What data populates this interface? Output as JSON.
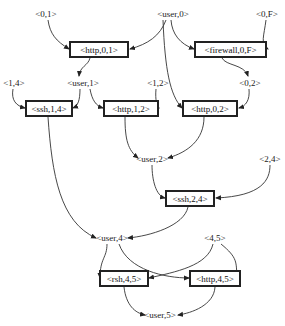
{
  "diagram": {
    "type": "attack-graph",
    "state_nodes": [
      {
        "id": "p01",
        "label": "<0,1>",
        "x": 46,
        "y": 14
      },
      {
        "id": "user0",
        "label": "<user,0>",
        "x": 173,
        "y": 14
      },
      {
        "id": "p0F",
        "label": "<0,F>",
        "x": 267,
        "y": 14
      },
      {
        "id": "p14",
        "label": "<1,4>",
        "x": 14,
        "y": 83
      },
      {
        "id": "user1",
        "label": "<user,1>",
        "x": 83,
        "y": 83
      },
      {
        "id": "p12",
        "label": "<1,2>",
        "x": 158,
        "y": 83
      },
      {
        "id": "p02",
        "label": "<0,2>",
        "x": 250,
        "y": 83
      },
      {
        "id": "user2",
        "label": "<user,2>",
        "x": 152,
        "y": 159
      },
      {
        "id": "p24",
        "label": "<2,4>",
        "x": 270,
        "y": 159
      },
      {
        "id": "user4",
        "label": "<user,4>",
        "x": 112,
        "y": 238
      },
      {
        "id": "p45",
        "label": "<4,5>",
        "x": 215,
        "y": 238
      },
      {
        "id": "user5",
        "label": "<user,5>",
        "x": 160,
        "y": 315
      }
    ],
    "action_nodes": [
      {
        "id": "http01",
        "label": "<http,0,1>",
        "x": 69,
        "y": 41,
        "w": 60,
        "h": 17
      },
      {
        "id": "fw0F",
        "label": "<firewall,0,F>",
        "x": 194,
        "y": 41,
        "w": 73,
        "h": 17
      },
      {
        "id": "ssh14",
        "label": "<ssh,1,4>",
        "x": 25,
        "y": 100,
        "w": 48,
        "h": 17
      },
      {
        "id": "http12",
        "label": "<http,1,2>",
        "x": 103,
        "y": 100,
        "w": 56,
        "h": 17
      },
      {
        "id": "http02",
        "label": "<http,0,2>",
        "x": 182,
        "y": 100,
        "w": 56,
        "h": 17
      },
      {
        "id": "ssh24",
        "label": "<ssh,2,4>",
        "x": 165,
        "y": 190,
        "w": 50,
        "h": 17
      },
      {
        "id": "rsh45",
        "label": "<rsh,4,5>",
        "x": 99,
        "y": 270,
        "w": 50,
        "h": 17
      },
      {
        "id": "http45",
        "label": "<http,4,5>",
        "x": 189,
        "y": 270,
        "w": 52,
        "h": 17
      }
    ],
    "edges": [
      {
        "from": "<0,1>",
        "to": "<http,0,1>",
        "d": "M48,20 C50,34 56,41 69,49"
      },
      {
        "from": "<user,0>",
        "to": "<http,0,1>",
        "d": "M166,20 C160,36 148,44 130,49"
      },
      {
        "from": "<user,0>",
        "to": "<firewall,0,F>",
        "d": "M171,20 C172,34 180,44 194,49"
      },
      {
        "from": "<0,F>",
        "to": "<firewall,0,F>",
        "d": "M266,20 C264,36 260,44 268,49"
      },
      {
        "from": "<http,0,1>",
        "to": "<user,1>",
        "d": "M90,58 C88,66 80,66 79,76"
      },
      {
        "from": "<firewall,0,F>",
        "to": "<0,2>",
        "d": "M222,58 C226,66 244,64 248,76"
      },
      {
        "from": "<user,0>",
        "to": "<http,0,2>",
        "d": "M163,20 C165,70 170,95 182,108"
      },
      {
        "from": "<0,2>",
        "to": "<http,0,2>",
        "d": "M249,89 C250,100 246,106 239,108"
      },
      {
        "from": "<1,4>",
        "to": "<ssh,1,4>",
        "d": "M13,89 C11,100 16,106 25,108"
      },
      {
        "from": "<user,1>",
        "to": "<ssh,1,4>",
        "d": "M80,89 C80,100 78,106 73,108"
      },
      {
        "from": "<user,1>",
        "to": "<http,1,2>",
        "d": "M90,89 C92,100 96,106 103,108"
      },
      {
        "from": "<1,2>",
        "to": "<http,1,2>",
        "d": "M156,89 C155,100 157,106 159,108"
      },
      {
        "from": "<http,1,2>",
        "to": "<user,2>",
        "d": "M125,117 C125,140 128,150 138,158"
      },
      {
        "from": "<http,0,2>",
        "to": "<user,2>",
        "d": "M204,117 C204,140 188,152 168,158"
      },
      {
        "from": "<user,2>",
        "to": "<ssh,2,4>",
        "d": "M152,165 C152,180 156,196 165,198"
      },
      {
        "from": "<2,4>",
        "to": "<ssh,2,4>",
        "d": "M270,165 C270,180 262,196 216,198"
      },
      {
        "from": "<ssh,1,4>",
        "to": "<user,4>",
        "d": "M48,117 C52,175 60,222 96,238"
      },
      {
        "from": "<ssh,2,4>",
        "to": "<user,4>",
        "d": "M188,207 C184,226 150,236 128,238"
      },
      {
        "from": "<user,4>",
        "to": "<rsh,4,5>",
        "d": "M107,244 C107,258 100,258 100,278"
      },
      {
        "from": "<user,4>",
        "to": "<http,4,5>",
        "d": "M119,244 C128,270 165,278 189,278"
      },
      {
        "from": "<4,5>",
        "to": "<rsh,4,5>",
        "d": "M213,244 C208,266 175,272 149,278"
      },
      {
        "from": "<4,5>",
        "to": "<http,4,5>",
        "d": "M221,244 C238,258 236,262 237,278"
      },
      {
        "from": "<rsh,4,5>",
        "to": "<user,5>",
        "d": "M124,287 C126,305 135,313 145,315"
      },
      {
        "from": "<http,4,5>",
        "to": "<user,5>",
        "d": "M215,287 C214,305 192,313 178,315"
      }
    ]
  }
}
